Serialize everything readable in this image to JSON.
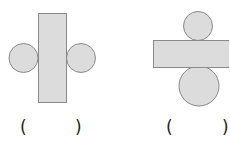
{
  "figures": [
    {
      "id": "figure-1",
      "description": "vertical rectangle with two circles on left and right sides",
      "answer_blank": {
        "open": "(",
        "close": ")"
      }
    },
    {
      "id": "figure-2",
      "description": "horizontal rectangle with one small circle on top and one larger circle below",
      "answer_blank": {
        "open": "(",
        "close": ")"
      }
    }
  ],
  "colors": {
    "fill": "#dcdcdc",
    "stroke": "#8a8a8a",
    "text": "#222222"
  }
}
